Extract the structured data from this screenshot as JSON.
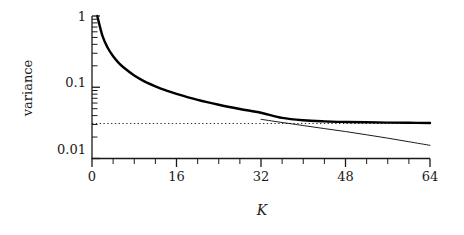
{
  "chart_data": {
    "type": "line",
    "title": "",
    "xlabel": "K",
    "ylabel": "variance",
    "xlim": [
      0,
      64
    ],
    "ylim": [
      0.01,
      1
    ],
    "yscale": "log",
    "xscale": "linear",
    "grid": false,
    "legend": "none",
    "xticks": [
      0,
      16,
      32,
      48,
      64
    ],
    "xticklabels": [
      "0",
      "16",
      "32",
      "48",
      "64"
    ],
    "xminor_tick_step": 4,
    "yticks": [
      1,
      0.1,
      0.01
    ],
    "yticklabels": [
      "1",
      "0.1",
      "0.01"
    ],
    "yminor_ticks": [
      0.9,
      0.8,
      0.7,
      0.6,
      0.5,
      0.4,
      0.3,
      0.2,
      0.09,
      0.08,
      0.07,
      0.06,
      0.05,
      0.04,
      0.03,
      0.02
    ],
    "annotations": [
      {
        "type": "hline",
        "y": 0.031,
        "style": "dotted",
        "label": "asymptotic variance floor"
      }
    ],
    "series": [
      {
        "name": "thick-curve",
        "style": "solid-thick",
        "color": "#000000",
        "linewidth": 2.4,
        "x": [
          1,
          2,
          3,
          4,
          5,
          6,
          8,
          10,
          12,
          14,
          16,
          20,
          24,
          28,
          32,
          36,
          40,
          44,
          48,
          52,
          56,
          60,
          64
        ],
        "y": [
          1.0,
          0.52,
          0.355,
          0.272,
          0.222,
          0.189,
          0.146,
          0.12,
          0.103,
          0.0905,
          0.0808,
          0.0666,
          0.0568,
          0.0496,
          0.0439,
          0.0372,
          0.0344,
          0.0332,
          0.0326,
          0.0322,
          0.0319,
          0.0317,
          0.0315
        ]
      },
      {
        "name": "thin-curve",
        "style": "solid-thin",
        "color": "#000000",
        "linewidth": 0.9,
        "x": [
          32,
          34,
          36,
          38,
          40,
          44,
          48,
          52,
          56,
          60,
          64
        ],
        "y": [
          0.0355,
          0.0337,
          0.032,
          0.0305,
          0.029,
          0.0263,
          0.0239,
          0.0215,
          0.0193,
          0.0172,
          0.0153
        ]
      }
    ]
  },
  "axes": {
    "ylabel_text": "variance",
    "xlabel_text": "K",
    "ytick_1": "1",
    "ytick_01": "0.1",
    "ytick_001": "0.01",
    "xtick_0": "0",
    "xtick_16": "16",
    "xtick_32": "32",
    "xtick_48": "48",
    "xtick_64": "64"
  },
  "colors": {
    "line": "#000000",
    "axis": "#1a1a1a",
    "dotted": "#333333",
    "background": "#ffffff"
  }
}
